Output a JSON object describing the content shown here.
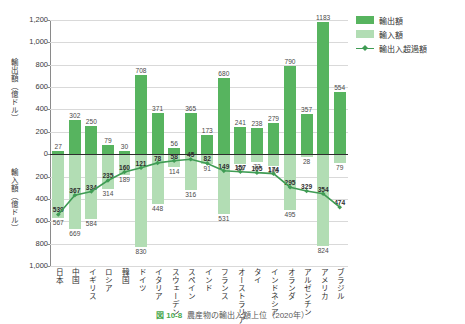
{
  "chart_data": {
    "type": "bar",
    "title": "農産物の輸出入額上位（2020年）",
    "figure_number": "図 10-8",
    "xlabel": "",
    "ylabel_top": "輸出額（億ドル）",
    "ylabel_bottom": "輸入額（億ドル）",
    "ylim_top": [
      0,
      1200
    ],
    "ylim_bottom": [
      0,
      1000
    ],
    "ytick_labels_top": [
      "1,200",
      "1,000",
      "800",
      "600",
      "400",
      "200",
      "0"
    ],
    "ytick_labels_bottom": [
      "200",
      "400",
      "600",
      "800",
      "1,000"
    ],
    "grid": true,
    "legend_position": "top-right",
    "categories": [
      "日本",
      "中国",
      "イギリス",
      "ロシア",
      "韓国",
      "ドイツ",
      "イタリア",
      "スウェーデン",
      "スペイン",
      "インド",
      "フランス",
      "オーストラリア",
      "タイ",
      "インドネシア",
      "オランダ",
      "アルゼンチン",
      "アメリカ",
      "ブラジル"
    ],
    "series": [
      {
        "name": "輸出額",
        "color": "#57b45f",
        "values": [
          27,
          302,
          250,
          79,
          30,
          708,
          371,
          56,
          365,
          173,
          680,
          241,
          238,
          279,
          790,
          357,
          1183,
          554
        ]
      },
      {
        "name": "輸入額",
        "color": "#b2ddb4",
        "values": [
          567,
          669,
          584,
          314,
          189,
          830,
          448,
          114,
          316,
          91,
          531,
          84,
          72,
          106,
          495,
          28,
          824,
          79
        ]
      },
      {
        "name": "輸出入超過額",
        "color": "#3f9c54",
        "values": [
          539,
          367,
          334,
          235,
          160,
          121,
          78,
          58,
          45,
          82,
          149,
          157,
          165,
          174,
          295,
          329,
          354,
          474
        ]
      }
    ]
  },
  "legend": {
    "items": [
      {
        "label": "輸出額",
        "type": "swatch-dark"
      },
      {
        "label": "輸入額",
        "type": "swatch-light"
      },
      {
        "label": "輸出入超過額",
        "type": "line-marker"
      }
    ]
  },
  "colors": {
    "export_bar": "#57b45f",
    "import_bar": "#b2ddb4",
    "balance_line": "#3f9c54",
    "zero_axis": "#2d2d2d",
    "gridline": "#d9d9d9"
  }
}
